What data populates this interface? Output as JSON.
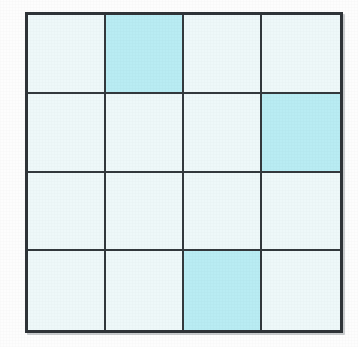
{
  "colors": {
    "page_background": "#ffffff",
    "grid_border": "#2f3438",
    "grid_line": "#33393d",
    "cell_empty": "#eef8f9",
    "cell_filled": "#b9ecf3"
  },
  "chart_data": {
    "type": "heatmap",
    "xlabel": "",
    "ylabel": "",
    "rows": 4,
    "columns": 4,
    "grid": [
      [
        0,
        1,
        0,
        0
      ],
      [
        0,
        0,
        0,
        1
      ],
      [
        0,
        0,
        0,
        0
      ],
      [
        0,
        0,
        1,
        0
      ]
    ],
    "shaded_count": 3,
    "total_cells": 16,
    "shaded_cells": [
      {
        "row": 1,
        "column": 2
      },
      {
        "row": 2,
        "column": 4
      },
      {
        "row": 4,
        "column": 3
      }
    ],
    "legend": [
      {
        "value": 0,
        "label": "unshaded",
        "color": "#eef8f9"
      },
      {
        "value": 1,
        "label": "shaded",
        "color": "#b9ecf3"
      }
    ],
    "grid_visible": true,
    "legend_position": "none"
  }
}
